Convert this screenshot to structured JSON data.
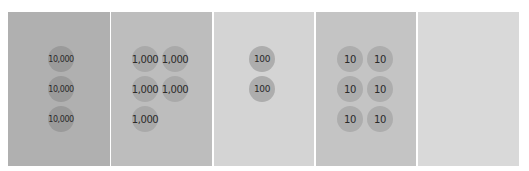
{
  "place_value_chart": {
    "columns": [
      {
        "place": "ten-thousands",
        "bg": "#b0b0b0",
        "chip_color": "#9a9a9a",
        "chip_label": "10,000",
        "count": 3
      },
      {
        "place": "thousands",
        "bg": "#bdbdbd",
        "chip_color": "#a9a9a9",
        "chip_label": "1,000",
        "count": 5
      },
      {
        "place": "hundreds",
        "bg": "#d4d4d4",
        "chip_color": "#adadad",
        "chip_label": "100",
        "count": 2
      },
      {
        "place": "tens",
        "bg": "#c4c4c4",
        "chip_color": "#adadad",
        "chip_label": "10",
        "count": 6
      },
      {
        "place": "ones",
        "bg": "#d9d9d9",
        "chip_color": "",
        "chip_label": "",
        "count": 0
      }
    ],
    "chips": {
      "c1_1": "10,000",
      "c1_2": "10,000",
      "c1_3": "10,000",
      "c2_1": "1,000",
      "c2_2": "1,000",
      "c2_3": "1,000",
      "c2_4": "1,000",
      "c2_5": "1,000",
      "c3_1": "100",
      "c3_2": "100",
      "c4_1": "10",
      "c4_2": "10",
      "c4_3": "10",
      "c4_4": "10",
      "c4_5": "10",
      "c4_6": "10"
    }
  }
}
